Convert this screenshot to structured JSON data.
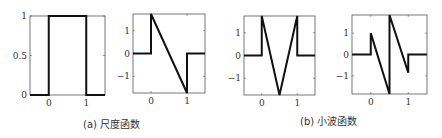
{
  "figure": {
    "captions": [
      {
        "label": "(a) 尺度函数"
      },
      {
        "label": "(b) 小波函数"
      }
    ]
  },
  "chart_data": [
    {
      "type": "line",
      "title": "",
      "group": "(a) 尺度函数",
      "xlabel": "",
      "ylabel": "",
      "xlim": [
        -0.5,
        1.5
      ],
      "ylim": [
        0,
        1
      ],
      "xticks": [
        0,
        1
      ],
      "yticks": [
        0,
        0.5,
        1
      ],
      "ytick_labels": [
        "0",
        "0.5",
        "1"
      ],
      "grid": false,
      "x": [
        -0.5,
        0,
        0,
        1,
        1,
        1.5
      ],
      "y": [
        0,
        0,
        1,
        1,
        0,
        0
      ]
    },
    {
      "type": "line",
      "title": "",
      "group": "(a) 尺度函数",
      "xlabel": "",
      "ylabel": "",
      "xlim": [
        -0.5,
        1.5
      ],
      "ylim": [
        -1.73,
        1.73
      ],
      "xticks": [
        0,
        1
      ],
      "yticks": [
        -1,
        0,
        1
      ],
      "ytick_labels": [
        "−1",
        "0",
        "1"
      ],
      "grid": false,
      "x": [
        -0.5,
        0,
        0,
        1,
        1,
        1.5
      ],
      "y": [
        0,
        0,
        1.73,
        -1.73,
        0,
        0
      ]
    },
    {
      "type": "line",
      "title": "",
      "group": "(b) 小波函数",
      "xlabel": "",
      "ylabel": "",
      "xlim": [
        -0.5,
        1.5
      ],
      "ylim": [
        -1.73,
        1.73
      ],
      "xticks": [
        0,
        1
      ],
      "yticks": [
        -1,
        0,
        1
      ],
      "ytick_labels": [
        "−1",
        "0",
        "1"
      ],
      "grid": false,
      "x": [
        -0.5,
        0,
        0,
        0.5,
        1,
        1,
        1.5
      ],
      "y": [
        0,
        0,
        1.73,
        -1.73,
        1.73,
        0,
        0
      ]
    },
    {
      "type": "line",
      "title": "",
      "group": "(b) 小波函数",
      "xlabel": "",
      "ylabel": "",
      "xlim": [
        -0.5,
        1.5
      ],
      "ylim": [
        -1.85,
        1.85
      ],
      "xticks": [
        0,
        1
      ],
      "yticks": [
        -1,
        0,
        1
      ],
      "ytick_labels": [
        "−1",
        "0",
        "1"
      ],
      "grid": false,
      "x": [
        -0.5,
        0,
        0,
        0.5,
        0.5,
        1,
        1,
        1.5
      ],
      "y": [
        0,
        0,
        1.0,
        -1.85,
        1.85,
        -0.85,
        0,
        0
      ]
    }
  ]
}
